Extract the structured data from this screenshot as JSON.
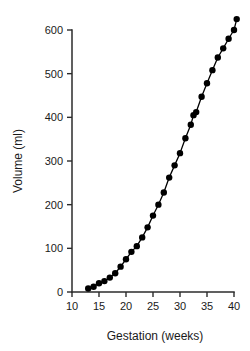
{
  "chart_data": {
    "type": "line",
    "title": "",
    "subtitle": "",
    "xlabel": "Gestation (weeks)",
    "ylabel": "Volume (ml)",
    "xlim": [
      10,
      41
    ],
    "ylim": [
      0,
      640
    ],
    "xticks": [
      10,
      15,
      20,
      25,
      30,
      35,
      40
    ],
    "xticklabels": [
      "10",
      "15",
      "20",
      "25",
      "30",
      "35",
      "40"
    ],
    "yticks": [
      0,
      100,
      200,
      300,
      400,
      500,
      600
    ],
    "yticklabels": [
      "0",
      "100",
      "200",
      "300",
      "400",
      "500",
      "600"
    ],
    "grid": false,
    "legend": null,
    "marker": "filled-circle",
    "series": [
      {
        "name": "Amniotic fluid volume",
        "x": [
          13,
          14,
          15,
          16,
          17,
          18,
          19,
          20,
          21,
          22,
          23,
          24,
          25,
          26,
          27,
          28,
          29,
          30,
          31,
          32,
          32.5,
          33,
          34,
          35,
          36,
          37,
          38,
          39,
          40,
          40.5
        ],
        "values": [
          8,
          12,
          20,
          25,
          33,
          43,
          58,
          75,
          92,
          105,
          125,
          148,
          175,
          200,
          228,
          262,
          290,
          318,
          352,
          383,
          405,
          412,
          447,
          478,
          508,
          537,
          558,
          580,
          600,
          625
        ]
      }
    ],
    "annotations": []
  }
}
